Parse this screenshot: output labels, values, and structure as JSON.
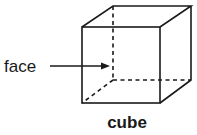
{
  "diagram": {
    "shape_label": "cube",
    "pointer_label": "face",
    "colors": {
      "stroke": "#1a1a1a",
      "background": "#ffffff"
    }
  }
}
